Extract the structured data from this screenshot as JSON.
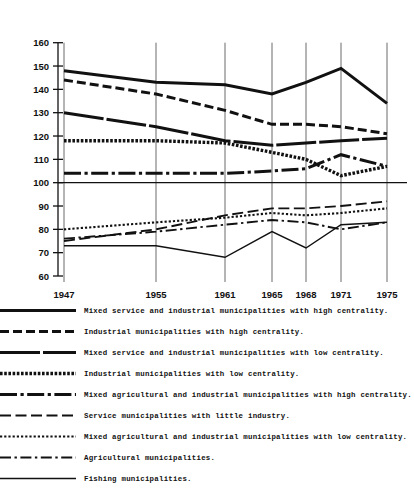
{
  "title": "",
  "chart_data": {
    "type": "line",
    "title": "",
    "xlabel": "",
    "ylabel": "",
    "categories": [
      "1947",
      "1955",
      "1961",
      "1965",
      "1968",
      "1971",
      "1975"
    ],
    "x_positions": [
      64,
      156,
      225,
      272,
      306,
      341,
      387
    ],
    "ylim": [
      60,
      160
    ],
    "ytick_step": 10,
    "yticks": [
      60,
      70,
      80,
      90,
      100,
      110,
      120,
      130,
      140,
      150,
      160
    ],
    "grid": "vertical-gridlines-plus-baseline-at-100",
    "baseline": 100,
    "legend_position": "below",
    "series": [
      {
        "name": "Mixed service and industrial municipalities with high centrality.",
        "style": "thick-solid",
        "values": [
          148,
          143,
          142,
          138,
          143,
          149,
          134
        ]
      },
      {
        "name": "Industrial municipalities with high centrality.",
        "style": "thick-dashed",
        "values": [
          144,
          138,
          131,
          125,
          125,
          124,
          121
        ]
      },
      {
        "name": "Mixed service and industrial municipalities with low centrality.",
        "style": "thick-solid-gapped",
        "values": [
          130,
          124,
          118,
          116,
          117,
          118,
          119
        ]
      },
      {
        "name": "Industrial municipalities with low centrality.",
        "style": "square-dotted",
        "values": [
          118,
          118,
          117,
          113,
          110,
          103,
          107
        ]
      },
      {
        "name": "Mixed agricultural and industrial municipalities with high centrality.",
        "style": "long-dash-dot",
        "values": [
          104,
          104,
          104,
          105,
          106,
          112,
          107
        ]
      },
      {
        "name": "Service municipalities with little industry.",
        "style": "long-dashed",
        "values": [
          75,
          80,
          86,
          89,
          89,
          90,
          92
        ]
      },
      {
        "name": "Mixed agricultural and industrial municipalities with low centrality.",
        "style": "fine-dotted",
        "values": [
          80,
          83,
          85,
          87,
          86,
          87,
          89
        ]
      },
      {
        "name": "Agricultural municipalities.",
        "style": "dash-dot-dash",
        "values": [
          76,
          79,
          82,
          84,
          83,
          80,
          83
        ]
      },
      {
        "name": "Fishing municipalities.",
        "style": "thin-solid",
        "values": [
          73,
          73,
          68,
          79,
          72,
          82,
          83
        ]
      }
    ]
  },
  "legend": {
    "items": [
      {
        "label": "Mixed service and industrial municipalities with high centrality.",
        "style": "thick-solid"
      },
      {
        "label": "Industrial municipalities with high centrality.",
        "style": "thick-dashed"
      },
      {
        "label": "Mixed service and industrial municipalities with low centrality.",
        "style": "thick-solid-gapped"
      },
      {
        "label": "Industrial municipalities with low centrality.",
        "style": "square-dotted"
      },
      {
        "label": "Mixed agricultural and industrial municipalities with high centrality.",
        "style": "long-dash-dot"
      },
      {
        "label": "Service municipalities with little industry.",
        "style": "long-dashed"
      },
      {
        "label": "Mixed agricultural and industrial municipalities with low centrality.",
        "style": "fine-dotted"
      },
      {
        "label": "Agricultural municipalities.",
        "style": "dash-dot-dash"
      },
      {
        "label": "Fishing municipalities.",
        "style": "thin-solid"
      }
    ]
  }
}
